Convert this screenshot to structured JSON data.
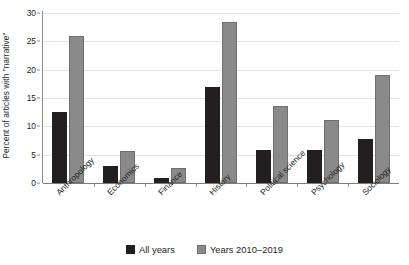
{
  "chart_data": {
    "type": "bar",
    "title": "",
    "subtitle": "",
    "xlabel": "",
    "ylabel": "Percent of articles with \"narrative\"",
    "ylim": [
      0,
      30
    ],
    "yticks": [
      0,
      5,
      10,
      15,
      20,
      25,
      30
    ],
    "grid": true,
    "legend_position": "bottom",
    "categories": [
      "Anthropology",
      "Economics",
      "Finance",
      "History",
      "Political science",
      "Psychology",
      "Sociology"
    ],
    "series": [
      {
        "name": "All years",
        "color": "#231f20",
        "values": [
          12.5,
          3.0,
          0.9,
          16.9,
          5.8,
          5.8,
          7.8
        ]
      },
      {
        "name": "Years 2010–2019",
        "color": "#8a8a8a",
        "values": [
          26.0,
          5.7,
          2.6,
          28.5,
          13.6,
          11.1,
          19.0
        ]
      }
    ]
  },
  "legend": {
    "items": [
      {
        "label": "All years",
        "swatch": "all"
      },
      {
        "label": "Years 2010–2019",
        "swatch": "recent"
      }
    ]
  },
  "colors": {
    "all_years": "#231f20",
    "recent_years": "#8a8a8a",
    "gridline": "#e3e3e3",
    "axis": "#8c8c8c",
    "background": "#ffffff"
  }
}
